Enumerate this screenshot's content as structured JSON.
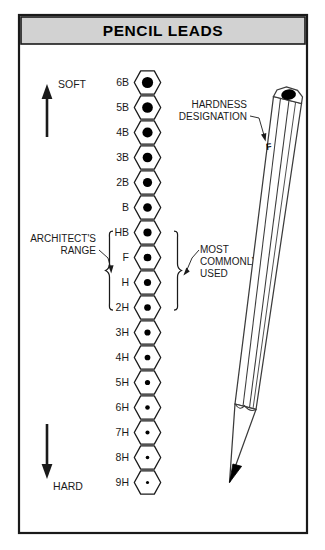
{
  "title": "PENCIL LEADS",
  "frame": {
    "background": "#ffffff",
    "border_color": "#1a1a1a",
    "title_bar_color": "#d2d2d2"
  },
  "scale": {
    "soft_label": "SOFT",
    "hard_label": "HARD",
    "grades": [
      {
        "label": "6B",
        "dot": 5.6
      },
      {
        "label": "5B",
        "dot": 5.35
      },
      {
        "label": "4B",
        "dot": 5.1
      },
      {
        "label": "3B",
        "dot": 4.85
      },
      {
        "label": "2B",
        "dot": 4.6
      },
      {
        "label": "B",
        "dot": 4.35
      },
      {
        "label": "HB",
        "dot": 4.1
      },
      {
        "label": "F",
        "dot": 3.85
      },
      {
        "label": "H",
        "dot": 3.6
      },
      {
        "label": "2H",
        "dot": 3.35
      },
      {
        "label": "3H",
        "dot": 3.1
      },
      {
        "label": "4H",
        "dot": 2.85
      },
      {
        "label": "5H",
        "dot": 2.6
      },
      {
        "label": "6H",
        "dot": 2.3
      },
      {
        "label": "7H",
        "dot": 2.05
      },
      {
        "label": "8H",
        "dot": 1.8
      },
      {
        "label": "9H",
        "dot": 1.55
      }
    ]
  },
  "annotations": {
    "architects_range": {
      "line1": "ARCHITECT'S",
      "line2": "RANGE",
      "spans": [
        "HB",
        "F",
        "H",
        "2H"
      ]
    },
    "most_commonly_used": {
      "line1": "MOST",
      "line2": "COMMONLY",
      "line3": "USED",
      "spans": [
        "HB",
        "F",
        "H",
        "2H"
      ]
    },
    "hardness_designation": {
      "line1": "HARDNESS",
      "line2": "DESIGNATION"
    }
  },
  "pencil": {
    "marking": "F",
    "lead_color": "#000000",
    "body_color": "#ffffff"
  }
}
